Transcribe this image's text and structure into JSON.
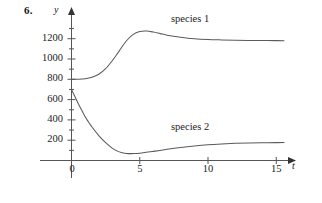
{
  "figure": {
    "exercise_number": "6.",
    "y_axis_name": "y",
    "x_axis_name": "t",
    "origin_label": "0"
  },
  "labels": {
    "species_1": "species 1",
    "species_2": "species 2"
  },
  "chart_data": {
    "type": "line",
    "title": "",
    "xlabel": "t",
    "ylabel": "y",
    "xlim": [
      0,
      16.5
    ],
    "ylim": [
      0,
      1340
    ],
    "grid": false,
    "legend": "inline-labels",
    "x_ticks": [
      5,
      10,
      15
    ],
    "x_tick_labels": [
      "5",
      "10",
      "15"
    ],
    "y_ticks": [
      200,
      400,
      600,
      800,
      1000,
      1200
    ],
    "y_tick_labels": [
      "200",
      "400",
      "600",
      "800",
      "1000",
      "1200"
    ],
    "y_minor_ticks": [
      100,
      300,
      500,
      700,
      900,
      1100,
      1300
    ],
    "series": [
      {
        "name": "species 1",
        "label_position": {
          "x": 8.0,
          "y": 1290
        },
        "x": [
          0,
          0.5,
          1.0,
          1.5,
          2.0,
          2.5,
          3.0,
          3.5,
          4.0,
          4.5,
          5.0,
          5.5,
          6.0,
          6.5,
          7.0,
          8.0,
          9.0,
          10.0,
          11.0,
          12.0,
          13.0,
          14.0,
          15.0,
          15.6
        ],
        "values": [
          800,
          800,
          805,
          820,
          850,
          905,
          985,
          1080,
          1175,
          1240,
          1270,
          1275,
          1265,
          1250,
          1235,
          1215,
          1200,
          1192,
          1188,
          1185,
          1183,
          1182,
          1181,
          1180
        ]
      },
      {
        "name": "species 2",
        "label_position": {
          "x": 8.0,
          "y": 210
        },
        "x": [
          0,
          0.25,
          0.5,
          0.75,
          1.0,
          1.25,
          1.5,
          2.0,
          2.5,
          3.0,
          3.5,
          4.0,
          4.5,
          5.0,
          6.0,
          7.0,
          8.0,
          9.0,
          10.0,
          11.0,
          12.0,
          13.0,
          14.0,
          15.0,
          15.6
        ],
        "values": [
          700,
          630,
          560,
          495,
          430,
          380,
          330,
          245,
          175,
          120,
          85,
          70,
          68,
          72,
          90,
          110,
          128,
          143,
          155,
          163,
          169,
          173,
          175,
          176,
          177
        ]
      }
    ]
  }
}
